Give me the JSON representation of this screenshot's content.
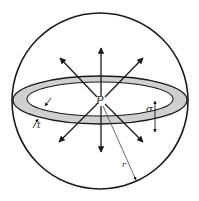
{
  "diagram": {
    "labels": {
      "center": "P",
      "thickness": "t",
      "width": "σ",
      "radius": "r"
    },
    "colors": {
      "stroke": "#1a1a1a",
      "ring_fill": "#cfcfcf",
      "background": "#ffffff"
    }
  }
}
